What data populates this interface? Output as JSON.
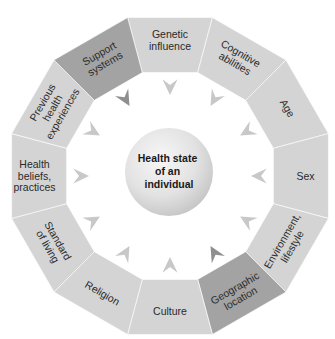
{
  "diagram": {
    "title": "Health state of an individual",
    "center": {
      "lines": [
        "Health state",
        "of an",
        "individual"
      ]
    },
    "segments": [
      {
        "id": "genetic-influence",
        "lines": [
          "Genetic",
          "influence"
        ],
        "fill": "#d4d4d4",
        "highlight": false
      },
      {
        "id": "cognitive-abilities",
        "lines": [
          "Cognitive",
          "abilities"
        ],
        "fill": "#d4d4d4",
        "highlight": false
      },
      {
        "id": "age",
        "lines": [
          "Age"
        ],
        "fill": "#d4d4d4",
        "highlight": false
      },
      {
        "id": "sex",
        "lines": [
          "Sex"
        ],
        "fill": "#d4d4d4",
        "highlight": false
      },
      {
        "id": "environment-lifestyle",
        "lines": [
          "Environment,",
          "lifestyle"
        ],
        "fill": "#d4d4d4",
        "highlight": false
      },
      {
        "id": "geographic-location",
        "lines": [
          "Geographic",
          "location"
        ],
        "fill": "#a3a3a3",
        "highlight": true
      },
      {
        "id": "culture",
        "lines": [
          "Culture"
        ],
        "fill": "#d4d4d4",
        "highlight": false
      },
      {
        "id": "religion",
        "lines": [
          "Religion"
        ],
        "fill": "#d4d4d4",
        "highlight": false
      },
      {
        "id": "standard-of-living",
        "lines": [
          "Standard",
          "of living"
        ],
        "fill": "#d4d4d4",
        "highlight": false
      },
      {
        "id": "health-beliefs-practices",
        "lines": [
          "Health",
          "beliefs,",
          "practices"
        ],
        "fill": "#d4d4d4",
        "highlight": false
      },
      {
        "id": "previous-health-experiences",
        "lines": [
          "Previous",
          "health",
          "experiences"
        ],
        "fill": "#d4d4d4",
        "highlight": false
      },
      {
        "id": "support-systems",
        "lines": [
          "Support",
          "systems"
        ],
        "fill": "#a3a3a3",
        "highlight": true
      }
    ],
    "colors": {
      "segment_light": "#d4d4d4",
      "segment_dark": "#a3a3a3",
      "arrow_light": "#c8c8c8",
      "arrow_dark": "#8f8f8f",
      "text": "#2a2a2a",
      "center_fill": "#dcdcdc"
    }
  }
}
